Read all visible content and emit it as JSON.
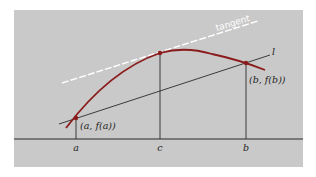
{
  "diagram": {
    "colors": {
      "background": "#c9c9c9",
      "curve": "#8b1a1a",
      "tangent": "#ffffff",
      "lines": "#2a2a2a"
    },
    "labels": {
      "tangent": "tangent",
      "secant": "l",
      "point_a": "(a, f(a))",
      "point_b": "(b, f(b))",
      "axis_a": "a",
      "axis_c": "c",
      "axis_b": "b"
    },
    "points": {
      "a": {
        "x": 76,
        "y": 118
      },
      "c": {
        "x": 160,
        "y": 53
      },
      "b": {
        "x": 246,
        "y": 63
      }
    }
  }
}
